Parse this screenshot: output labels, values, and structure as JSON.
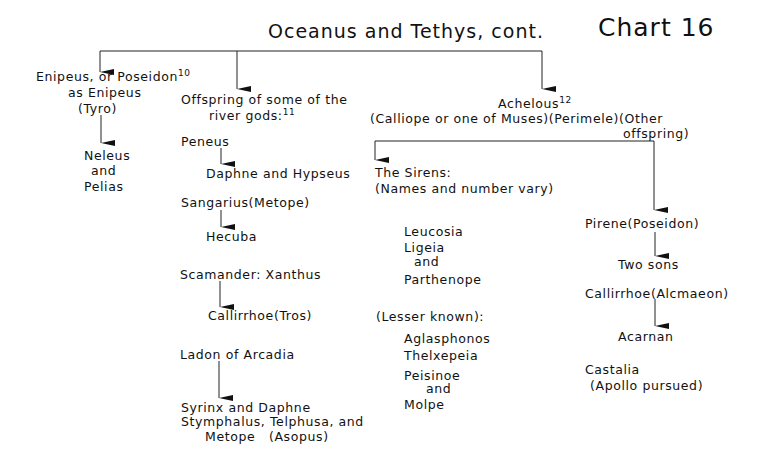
{
  "header": {
    "title": "Oceanus and Tethys, cont.",
    "chart_label": "Chart 16"
  },
  "branches": {
    "enipeus": {
      "line1": "Enipeus, or Poseidon",
      "footnote": "10",
      "line2": "as Enipeus",
      "line3": "(Tyro)",
      "children": [
        "Neleus",
        "and",
        "Pelias"
      ]
    },
    "river_gods": {
      "line1": "Offspring of some of the",
      "line2": "river gods:",
      "footnote": "11",
      "peneus": "Peneus",
      "peneus_children": "Daphne and Hypseus",
      "sangarius": "Sangarius(Metope)",
      "sangarius_children": "Hecuba",
      "scamander": "Scamander: Xanthus",
      "scamander_children": "Callirrhoe(Tros)",
      "ladon": "Ladon of Arcadia",
      "ladon_children_1": "Syrinx and Daphne",
      "asopus_line1": "Stymphalus, Telphusa, and",
      "asopus_line2": "Metope   (Asopus)"
    },
    "achelous": {
      "name": "Achelous",
      "footnote": "12",
      "spouses": "(Calliope or one of Muses)(Perimele)(Other",
      "spouses_cont": "offspring)",
      "sirens": {
        "title": "The Sirens:",
        "subtitle": "(Names and number vary)",
        "names": [
          "Leucosia",
          "Ligeia",
          "and",
          "Parthenope"
        ],
        "lesser_label": "(Lesser known):",
        "lesser_names": [
          "Aglasphonos",
          "Thelxepeia",
          "Peisinoe",
          "and",
          "Molpe"
        ]
      },
      "other": {
        "pirene": "Pirene(Poseidon)",
        "pirene_children": "Two sons",
        "callirrhoe": "Callirrhoe(Alcmaeon)",
        "callirrhoe_children": "Acarnan",
        "castalia": "Castalia",
        "castalia_note": "(Apollo pursued)"
      }
    }
  }
}
